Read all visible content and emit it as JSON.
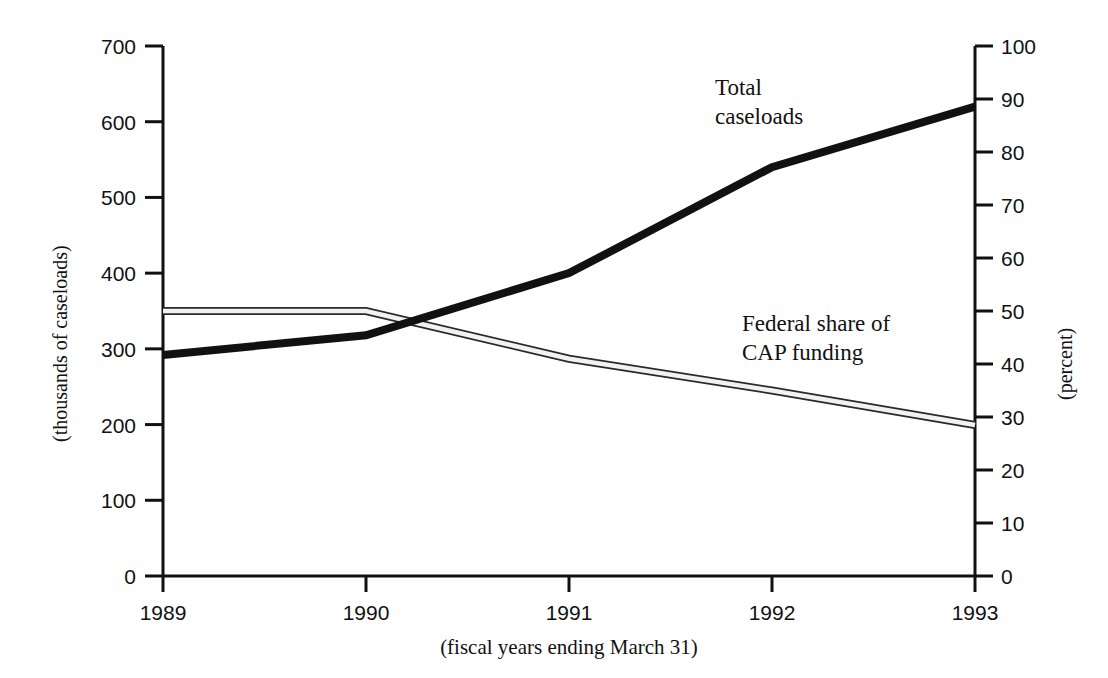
{
  "chart_data": {
    "type": "line",
    "title": "",
    "xlabel": "(fiscal years ending March 31)",
    "ylabel": "(thousands of caseloads)",
    "y2label": "(percent)",
    "categories": [
      "1989",
      "1990",
      "1991",
      "1992",
      "1993"
    ],
    "x": [
      1989,
      1990,
      1991,
      1992,
      1993
    ],
    "xlim": [
      1989,
      1993
    ],
    "ylim": [
      0,
      700
    ],
    "y2lim": [
      0,
      100
    ],
    "yticks": [
      "0",
      "100",
      "200",
      "300",
      "400",
      "500",
      "600",
      "700"
    ],
    "ytick_values": [
      0,
      100,
      200,
      300,
      400,
      500,
      600,
      700
    ],
    "y2ticks": [
      "0",
      "10",
      "20",
      "30",
      "40",
      "50",
      "60",
      "70",
      "80",
      "90",
      "100"
    ],
    "y2tick_values": [
      0,
      10,
      20,
      30,
      40,
      50,
      60,
      70,
      80,
      90,
      100
    ],
    "xticks": [
      "1989",
      "1990",
      "1991",
      "1992",
      "1993"
    ],
    "grid": false,
    "legend_position": "inline-annotations",
    "series": [
      {
        "name": "Total caseloads",
        "axis": "left",
        "style": "solid-thick-black",
        "color": "#111111",
        "values": [
          292,
          318,
          400,
          540,
          620
        ],
        "label": "Total\ncaseloads",
        "label_line1": "Total",
        "label_line2": "caseloads"
      },
      {
        "name": "Federal share of CAP funding",
        "axis": "right",
        "style": "outlined-band",
        "color": "#888888",
        "values": [
          50,
          50,
          41,
          35,
          28.5
        ],
        "label": "Federal share of\nCAP funding",
        "label_line1": "Federal share of",
        "label_line2": "CAP funding"
      }
    ]
  },
  "annotations": {
    "total_caseloads_line1": "Total",
    "total_caseloads_line2": "caseloads",
    "federal_share_line1": "Federal share of",
    "federal_share_line2": "CAP funding"
  },
  "axes": {
    "left_title": "(thousands of caseloads)",
    "right_title": "(percent)",
    "bottom_title": "(fiscal years ending March 31)"
  }
}
